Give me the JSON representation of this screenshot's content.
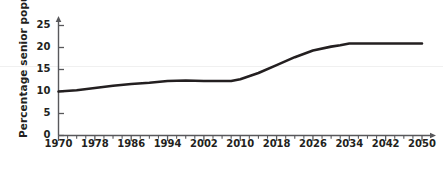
{
  "chart_data": {
    "type": "line",
    "title": "",
    "xlabel": "",
    "ylabel": "Percentage senior population",
    "xlim": [
      1970,
      2050
    ],
    "ylim": [
      0,
      27
    ],
    "grid": false,
    "legend": null,
    "y_ticks": [
      0,
      5,
      10,
      15,
      20,
      25
    ],
    "x_ticks": [
      1970,
      1978,
      1986,
      1994,
      2002,
      2010,
      2018,
      2026,
      2034,
      2042,
      2050
    ],
    "x_minor_tick_step": 2,
    "series": [
      {
        "name": "Percentage senior population",
        "color": "#231f20",
        "x": [
          1970,
          1974,
          1978,
          1982,
          1986,
          1990,
          1994,
          1998,
          2002,
          2006,
          2008,
          2010,
          2014,
          2018,
          2022,
          2026,
          2030,
          2032,
          2034,
          2038,
          2042,
          2046,
          2050
        ],
        "values": [
          10.0,
          10.3,
          10.8,
          11.3,
          11.7,
          12.0,
          12.4,
          12.5,
          12.4,
          12.4,
          12.4,
          12.8,
          14.2,
          16.0,
          17.8,
          19.3,
          20.2,
          20.5,
          20.9,
          20.9,
          20.9,
          20.9,
          20.9
        ]
      }
    ]
  },
  "axis": {
    "y_tick_labels": [
      "25",
      "20",
      "15",
      "10",
      "5",
      "0"
    ],
    "x_tick_labels": [
      "1970",
      "1978",
      "1986",
      "1994",
      "2002",
      "2010",
      "2018",
      "2026",
      "2034",
      "2042",
      "2050"
    ]
  },
  "colors": {
    "line": "#231f20",
    "axis": "#58585b",
    "text": "#231f20",
    "faint_rule": "#f0f0f0",
    "background": "#ffffff"
  }
}
